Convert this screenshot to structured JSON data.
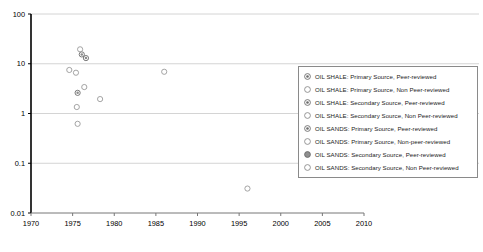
{
  "chart_data": {
    "type": "scatter",
    "title": "",
    "xlabel": "",
    "ylabel": "",
    "xlim": [
      1970,
      2010
    ],
    "ylim": [
      0.01,
      100
    ],
    "yscale": "log",
    "xticks": [
      1970,
      1975,
      1980,
      1985,
      1990,
      1995,
      2000,
      2005,
      2010
    ],
    "xtick_labels": [
      "1970",
      "1975",
      "1980",
      "1985",
      "1990",
      "1995",
      "2000",
      "2005",
      "2010"
    ],
    "yticks": [
      0.01,
      0.1,
      1,
      10,
      100
    ],
    "ytick_labels": [
      "0.01",
      "0.1",
      "1",
      "10",
      "100"
    ],
    "grid": "horizontal",
    "legend_position": "right",
    "series": [
      {
        "name": "OIL SHALE: Primary Source, Peer-reviewed",
        "marker": "dotted-circle",
        "fill": "#8c8c8c",
        "edge": "#6b6b6b",
        "points": [
          {
            "x": 1975.6,
            "y": 2.6
          },
          {
            "x": 2004.6,
            "y": 7.2
          },
          {
            "x": 2005.0,
            "y": 4.6
          },
          {
            "x": 2005.2,
            "y": 2.1
          }
        ]
      },
      {
        "name": "OIL SHALE: Primary Source, Non Peer-reviewed",
        "marker": "open-circle",
        "fill": "none",
        "edge": "#9a9a9a",
        "points": [
          {
            "x": 1974.6,
            "y": 7.5
          },
          {
            "x": 1975.4,
            "y": 6.6
          },
          {
            "x": 1976.4,
            "y": 3.4
          },
          {
            "x": 1975.5,
            "y": 1.35
          },
          {
            "x": 1975.6,
            "y": 0.62
          },
          {
            "x": 1978.3,
            "y": 1.95
          },
          {
            "x": 1986.0,
            "y": 6.9
          },
          {
            "x": 1996.0,
            "y": 0.031
          }
        ]
      },
      {
        "name": "OIL SHALE: Secondary Source, Peer-reviewed",
        "marker": "dotted-circle",
        "fill": "#8c8c8c",
        "edge": "#6b6b6b",
        "points": [
          {
            "x": 1976.6,
            "y": 13.0
          },
          {
            "x": 1976.1,
            "y": 15.4
          }
        ]
      },
      {
        "name": "OIL SHALE: Secondary Source, Non Peer-reviewed",
        "marker": "open-circle",
        "fill": "none",
        "edge": "#9a9a9a",
        "points": [
          {
            "x": 1975.9,
            "y": 19.5
          },
          {
            "x": 2007.8,
            "y": 6.8
          }
        ]
      },
      {
        "name": "OIL SANDS: Primary Source, Peer-reviewed",
        "marker": "dotted-circle",
        "fill": "#7d7d7d",
        "edge": "#5f5f5f",
        "points": [
          {
            "x": 2005.2,
            "y": 0.76
          }
        ]
      },
      {
        "name": "OIL SANDS: Primary Source, Non-peer-reviewed",
        "marker": "open-circle",
        "fill": "none",
        "edge": "#9a9a9a",
        "points": [
          {
            "x": 2007.9,
            "y": 0.78
          }
        ]
      },
      {
        "name": "OIL SANDS: Secondary Source, Peer-reviewed",
        "marker": "shaded-circle",
        "fill": "#8f8f8f",
        "edge": "#6b6b6b",
        "points": []
      },
      {
        "name": "OIL SANDS: Secondary Source, Non Peer-reviewed",
        "marker": "open-circle",
        "fill": "none",
        "edge": "#9a9a9a",
        "points": []
      }
    ]
  },
  "legend": {
    "items": [
      {
        "label": "OIL SHALE: Primary Source, Peer-reviewed",
        "marker": "dotted-circle"
      },
      {
        "label": "OIL SHALE: Primary Source, Non Peer-reviewed",
        "marker": "open-circle"
      },
      {
        "label": "OIL SHALE: Secondary Source, Peer-reviewed",
        "marker": "dotted-circle"
      },
      {
        "label": "OIL SHALE: Secondary Source, Non Peer-reviewed",
        "marker": "open-circle"
      },
      {
        "label": "OIL SANDS: Primary Source, Peer-reviewed",
        "marker": "dotted-circle"
      },
      {
        "label": "OIL SANDS: Primary Source, Non-peer-reviewed",
        "marker": "open-circle"
      },
      {
        "label": "OIL SANDS: Secondary Source, Peer-reviewed",
        "marker": "shaded-circle"
      },
      {
        "label": "OIL SANDS: Secondary Source, Non Peer-reviewed",
        "marker": "open-circle"
      }
    ]
  },
  "colors": {
    "axis": "#000000",
    "grid": "#c9c9c9",
    "legend_border": "#8a8a8a",
    "marker_edge": "#9a9a9a",
    "marker_fill": "#8c8c8c",
    "text": "#1b1b1b"
  }
}
